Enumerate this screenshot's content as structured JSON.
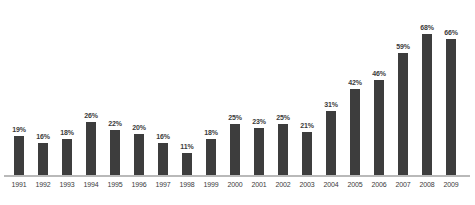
{
  "chart_data": {
    "type": "bar",
    "title": "",
    "subtitle": "",
    "xlabel": "",
    "ylabel": "",
    "ylim": [
      0,
      72
    ],
    "grid": false,
    "legend": "none",
    "value_suffix": "%",
    "bar_color": "#3d3d3d",
    "axis_color": "#b9b9b9",
    "label_color": "#3b3b3b",
    "background_color": "#ffffff",
    "categories": [
      "1991",
      "1992",
      "1993",
      "1994",
      "1995",
      "1996",
      "1997",
      "1998",
      "1999",
      "2000",
      "2001",
      "2002",
      "2003",
      "2004",
      "2005",
      "2006",
      "2007",
      "2008",
      "2009"
    ],
    "values": [
      19,
      16,
      18,
      26,
      22,
      20,
      16,
      11,
      18,
      25,
      23,
      25,
      21,
      31,
      42,
      46,
      59,
      68,
      66
    ],
    "data_labels": [
      "19%",
      "16%",
      "18%",
      "26%",
      "22%",
      "20%",
      "16%",
      "11%",
      "18%",
      "25%",
      "23%",
      "25%",
      "21%",
      "31%",
      "42%",
      "46%",
      "59%",
      "68%",
      "66%"
    ]
  }
}
